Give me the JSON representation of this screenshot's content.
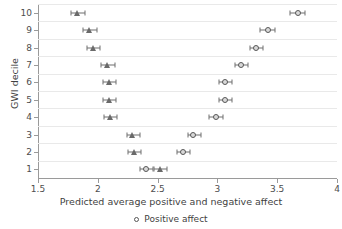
{
  "chart_data": {
    "type": "scatter",
    "title": "",
    "xlabel": "Predicted average positive and negative affect",
    "ylabel": "GWI decile",
    "xlim": [
      1.5,
      4
    ],
    "ylim": [
      0.5,
      10.5
    ],
    "xticks": [
      "1.5",
      "2",
      "2.5",
      "3",
      "3.5",
      "4"
    ],
    "xtick_values": [
      1.5,
      2,
      2.5,
      3,
      3.5,
      4
    ],
    "yticks": [
      "1",
      "2",
      "3",
      "4",
      "5",
      "6",
      "7",
      "8",
      "9",
      "10"
    ],
    "ytick_values": [
      1,
      2,
      3,
      4,
      5,
      6,
      7,
      8,
      9,
      10
    ],
    "grid": "horizontal",
    "legend_position": "bottom",
    "legend": [
      {
        "label": "Positive affect",
        "marker": "circle"
      }
    ],
    "series": [
      {
        "name": "Positive affect",
        "marker": "circle",
        "categories": [
          1,
          2,
          3,
          4,
          5,
          6,
          7,
          8,
          9,
          10
        ],
        "values": [
          2.4,
          2.71,
          2.8,
          2.99,
          3.06,
          3.06,
          3.2,
          3.32,
          3.42,
          3.67
        ],
        "ci_low": [
          2.35,
          2.66,
          2.75,
          2.93,
          3.01,
          3.01,
          3.15,
          3.27,
          3.36,
          3.61
        ],
        "ci_high": [
          2.46,
          2.77,
          2.86,
          3.05,
          3.12,
          3.12,
          3.26,
          3.38,
          3.48,
          3.73
        ]
      },
      {
        "name": "Negative affect",
        "marker": "triangle",
        "categories": [
          1,
          2,
          3,
          4,
          5,
          6,
          7,
          8,
          9,
          10
        ],
        "values": [
          2.52,
          2.3,
          2.29,
          2.1,
          2.09,
          2.09,
          2.08,
          1.96,
          1.93,
          1.83
        ],
        "ci_low": [
          2.47,
          2.25,
          2.24,
          2.05,
          2.04,
          2.04,
          2.03,
          1.91,
          1.88,
          1.78
        ],
        "ci_high": [
          2.58,
          2.36,
          2.35,
          2.16,
          2.15,
          2.15,
          2.14,
          2.02,
          1.99,
          1.89
        ]
      }
    ]
  }
}
